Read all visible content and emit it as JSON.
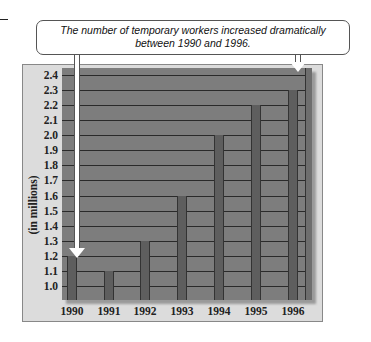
{
  "callout": {
    "text_line1": "The number of temporary workers increased dramatically",
    "text_line2": "between 1990 and 1996."
  },
  "colors": {
    "plot_background": "#7d7d7d",
    "bar": "#5e5e5e",
    "frame": "#dcdcdc",
    "gridline": "#2a2a2a"
  },
  "chart_data": {
    "type": "bar",
    "title": "",
    "annotation": "The number of temporary workers increased dramatically between 1990 and 1996.",
    "categories": [
      "1990",
      "1991",
      "1992",
      "1993",
      "1994",
      "1995",
      "1996"
    ],
    "values": [
      1.2,
      1.1,
      1.3,
      1.6,
      2.0,
      2.2,
      2.3
    ],
    "xlabel": "",
    "ylabel": "(in millions)",
    "yticks": [
      "2.4",
      "2.3",
      "2.2",
      "2.1",
      "2.0",
      "1.9",
      "1.8",
      "1.7",
      "1.6",
      "1.5",
      "1.4",
      "1.3",
      "1.2",
      "1.1",
      "1.0"
    ],
    "ylim": [
      0.9,
      2.45
    ],
    "grid": true,
    "legend": null,
    "arrows_point_to": [
      "1990",
      "1996"
    ]
  }
}
